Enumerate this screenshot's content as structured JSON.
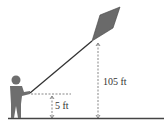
{
  "diagram": {
    "labels": {
      "person_height": "5 ft",
      "kite_height": "105 ft"
    },
    "colors": {
      "figure": "#6e6e6e",
      "kite": "#6a6a6a",
      "line": "#333333",
      "ground": "#444444"
    }
  }
}
